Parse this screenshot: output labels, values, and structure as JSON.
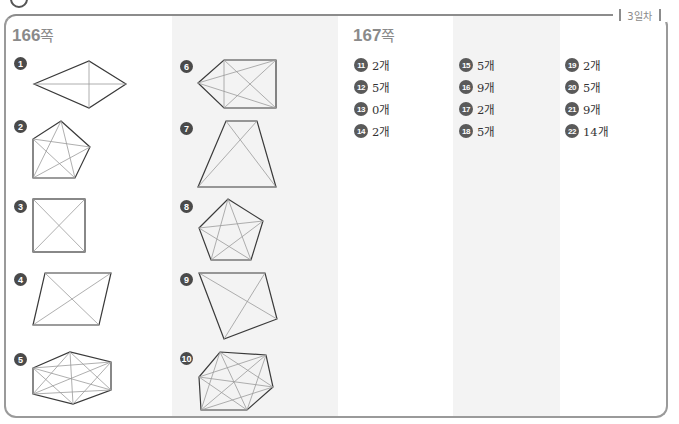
{
  "header": {
    "day_label": "3일차"
  },
  "page166": {
    "title_num": "166",
    "title_unit": "쪽",
    "problems": [
      {
        "n": "1",
        "shape": "rhombus"
      },
      {
        "n": "2",
        "shape": "pentagon"
      },
      {
        "n": "3",
        "shape": "square"
      },
      {
        "n": "4",
        "shape": "parallelogram"
      },
      {
        "n": "5",
        "shape": "hexagon"
      },
      {
        "n": "6",
        "shape": "pentagon-arrow"
      },
      {
        "n": "7",
        "shape": "trapezoid"
      },
      {
        "n": "8",
        "shape": "regular-pentagon"
      },
      {
        "n": "9",
        "shape": "quadrilateral"
      },
      {
        "n": "10",
        "shape": "hexagon-irregular"
      }
    ]
  },
  "page167": {
    "title_num": "167",
    "title_unit": "쪽",
    "answers": [
      {
        "n": "11",
        "value": "2개"
      },
      {
        "n": "12",
        "value": "5개"
      },
      {
        "n": "13",
        "value": "0개"
      },
      {
        "n": "14",
        "value": "2개"
      },
      {
        "n": "15",
        "value": "5개"
      },
      {
        "n": "16",
        "value": "9개"
      },
      {
        "n": "17",
        "value": "2개"
      },
      {
        "n": "18",
        "value": "5개"
      },
      {
        "n": "19",
        "value": "2개"
      },
      {
        "n": "20",
        "value": "5개"
      },
      {
        "n": "21",
        "value": "9개"
      },
      {
        "n": "22",
        "value": "14개"
      }
    ]
  }
}
